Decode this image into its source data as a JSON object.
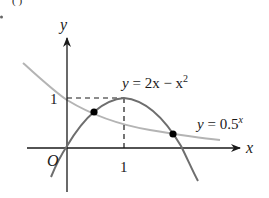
{
  "figure": {
    "clipped_top_fragment": "(  )",
    "axes": {
      "x_label": "x",
      "y_label": "y",
      "origin_label": "O",
      "x_tick_label": "1",
      "y_tick_label": "1"
    },
    "curves": [
      {
        "name": "parabola",
        "label_prefix": "y = 2x − x",
        "label_sup": "2",
        "equation": "y = 2x - x^2",
        "color": "#6e6e6e"
      },
      {
        "name": "exponential",
        "label_prefix": "y = 0.5",
        "label_sup": "x",
        "equation": "y = 0.5^x",
        "color": "#b4b4b4"
      }
    ],
    "intersection_points": [
      {
        "x": 0.52,
        "y": 0.7
      },
      {
        "x": 1.9,
        "y": 0.27
      }
    ],
    "guide_point": {
      "x": 1,
      "y": 1
    },
    "colors": {
      "axis": "#1a1a1a",
      "parabola": "#6e6e6e",
      "exponential": "#b4b4b4",
      "dashed_guides": "#1a1a1a",
      "points": "#000000"
    }
  }
}
